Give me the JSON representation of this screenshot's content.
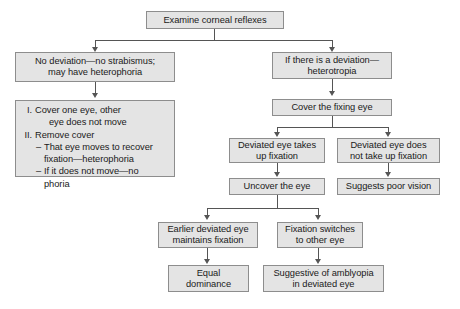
{
  "diagram": {
    "colors": {
      "node_fill": "#e4e4e4",
      "node_border": "#8d8d8d",
      "edge": "#555555",
      "text": "#1a1a1a",
      "background": "#ffffff"
    },
    "nodes": {
      "root": "Examine corneal reflexes",
      "no_deviation": "No deviation—no strabismus;\nmay have heterophoria",
      "deviation": "If there is a deviation—\nheterotropia",
      "cover_test_steps": {
        "item1_marker": "I.",
        "item1_line1": "Cover one eye, other",
        "item1_line2": "eye does not move",
        "item2_marker": "II.",
        "item2_line1": "Remove cover",
        "sub1_marker": "–",
        "sub1_line1": "That eye moves to recover",
        "sub1_line2": "fixation—heterophoria",
        "sub2_marker": "–",
        "sub2_line1": "If it does not move—no",
        "sub2_line2": "phoria"
      },
      "cover_fixing_eye": "Cover the fixing eye",
      "takes_up_fixation": "Deviated eye takes\nup fixation",
      "not_take_up_fixation": "Deviated eye does\nnot take up fixation",
      "uncover_the_eye": "Uncover the eye",
      "suggests_poor_vision": "Suggests poor vision",
      "maintains_fixation": "Earlier deviated eye\nmaintains fixation",
      "fixation_switches": "Fixation switches\nto other eye",
      "equal_dominance": "Equal\ndominance",
      "suggestive_amblyopia": "Suggestive of amblyopia\nin deviated eye"
    }
  }
}
